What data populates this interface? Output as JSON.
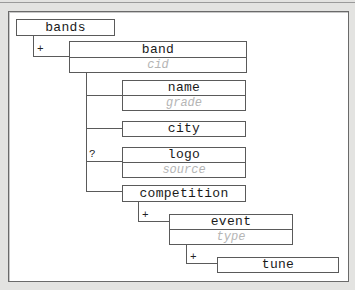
{
  "diagram": {
    "type": "tree",
    "nodes": [
      {
        "id": "bands",
        "label": "bands",
        "attribute": null,
        "parent": null,
        "cardinality": null
      },
      {
        "id": "band",
        "label": "band",
        "attribute": "cid",
        "parent": "bands",
        "cardinality": "+"
      },
      {
        "id": "name",
        "label": "name",
        "attribute": "grade",
        "parent": "band",
        "cardinality": null
      },
      {
        "id": "city",
        "label": "city",
        "attribute": null,
        "parent": "band",
        "cardinality": null
      },
      {
        "id": "logo",
        "label": "logo",
        "attribute": "source",
        "parent": "band",
        "cardinality": "?"
      },
      {
        "id": "competition",
        "label": "competition",
        "attribute": null,
        "parent": "band",
        "cardinality": null
      },
      {
        "id": "event",
        "label": "event",
        "attribute": "type",
        "parent": "competition",
        "cardinality": "+"
      },
      {
        "id": "tune",
        "label": "tune",
        "attribute": null,
        "parent": "event",
        "cardinality": "+"
      }
    ],
    "markers": {
      "one_or_more": "+",
      "optional": "?"
    },
    "colors": {
      "background": "#e3e3e1",
      "panel": "#ffffff",
      "line": "#5a5a5a",
      "attribute_text": "#b5b5b5",
      "label_text": "#1a1a1a"
    }
  }
}
